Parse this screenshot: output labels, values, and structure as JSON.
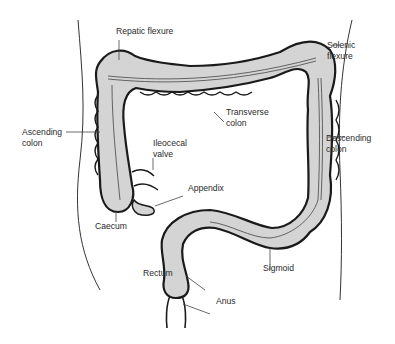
{
  "diagram": {
    "colors": {
      "colon_fill": "#d4d4d4",
      "outline": "#1a1a1a",
      "leader": "#444444",
      "background": "#ffffff"
    },
    "labels": {
      "hepatic_flexure": "Repatic flexure",
      "splenic_flexure": "Solenic\nflexure",
      "transverse_colon": "Transverse\ncolon",
      "ascending_colon": "Ascending\ncolon",
      "descending_colon": "Descending\ncolon",
      "ileocecal_valve": "Ileocecal\nvalve",
      "appendix": "Appendix",
      "caecum": "Caecum",
      "rectum": "Rectum",
      "sigmoid": "Sigmoid",
      "anus": "Anus"
    }
  }
}
